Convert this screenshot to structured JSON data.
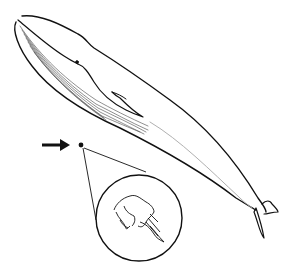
{
  "illustration": {
    "subject": "blue whale line drawing with magnified inset",
    "elements": [
      "whale",
      "pointer-arrow",
      "tiny-creature-dot",
      "magnifier-circle",
      "magnified-creature"
    ],
    "colors": {
      "background": "#ffffff",
      "stroke": "#111111",
      "light_stroke": "#b0b0b0"
    }
  }
}
